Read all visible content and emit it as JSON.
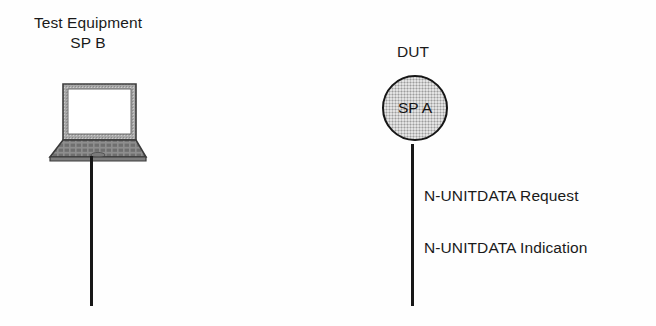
{
  "diagram": {
    "background_color": "#fefefe",
    "line_color": "#171717",
    "node_fill_color": "#c2c2c2"
  },
  "test_equipment": {
    "label_line1": "Test Equipment",
    "label_line2": "SP B",
    "icon": "laptop-icon"
  },
  "dut": {
    "label": "DUT",
    "node_label": "SP A",
    "icon": "circle-node-icon"
  },
  "messages": [
    {
      "text": "N-UNITDATA Request"
    },
    {
      "text": "N-UNITDATA Indication"
    }
  ],
  "connectors": [
    {
      "name": "test-equipment-lifeline"
    },
    {
      "name": "dut-lifeline"
    }
  ]
}
